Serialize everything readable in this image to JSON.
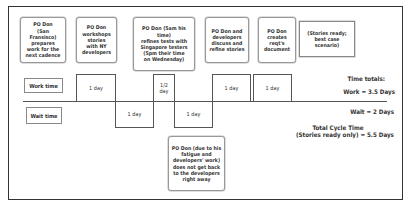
{
  "diagram": {
    "activities": [
      {
        "text": "PO Don\n(San Fransisco)\nprepares\nwork for the\nnext cadence"
      },
      {
        "text": "PO Don\nworkshops\nstories\nwith NY\ndevelopers"
      },
      {
        "text": "PO Don (5am his time)\nrefines tests with\nSingapore testers\n(5pm their time\non Wednesday)"
      },
      {
        "text": "PO Don and\ndevelopers\ndiscuss and\nrefine stories"
      },
      {
        "text": "PO Don\ncreates\nreqt's\ndocument"
      },
      {
        "text": "(Stories ready;\nbest case\nscenario)"
      },
      {
        "text": "PO Don (due to his\nfatigue and\ndevelopers' work)\ndoes not get back\nto the developers\nright away"
      }
    ],
    "row_labels": {
      "work": "Work time",
      "wait": "Wait time"
    },
    "timeline": [
      {
        "type": "work",
        "duration": "1 day"
      },
      {
        "type": "wait",
        "duration": "1 day"
      },
      {
        "type": "work",
        "duration": "1/2\nday"
      },
      {
        "type": "wait",
        "duration": "1 day"
      },
      {
        "type": "work",
        "duration": "1 day"
      },
      {
        "type": "work",
        "duration": "1 day"
      }
    ],
    "totals": {
      "heading": "Time totals:",
      "work": "Work = 3.5 Days",
      "wait": "Wait = 2 Days",
      "cycle_line1": "Total Cycle Time",
      "cycle_line2": "(Stories ready only) = 5.5 Days"
    }
  }
}
